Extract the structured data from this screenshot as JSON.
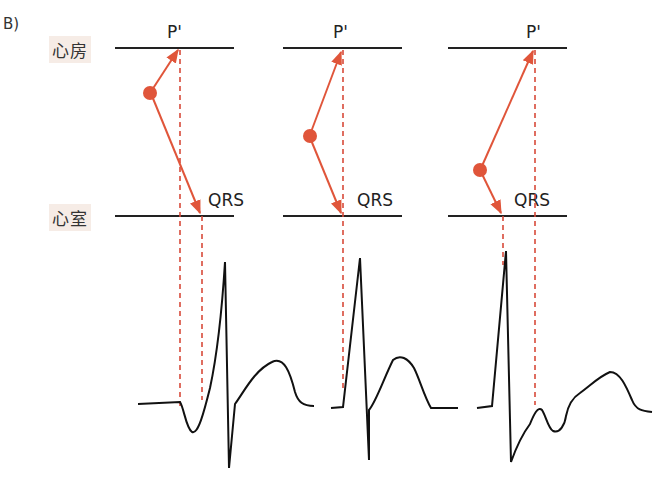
{
  "figure": {
    "panel_label": "B)",
    "chambers": {
      "atrium": "心房",
      "ventricle": "心室"
    },
    "panels": [
      {
        "p_label": "P'",
        "qrs_label": "QRS"
      },
      {
        "p_label": "P'",
        "qrs_label": "QRS"
      },
      {
        "p_label": "P'",
        "qrs_label": "QRS"
      }
    ],
    "colors": {
      "conduction": "#e0553a",
      "dashed": "#d84a3a",
      "line": "#222222",
      "label_bg": "#f6ece6"
    }
  }
}
